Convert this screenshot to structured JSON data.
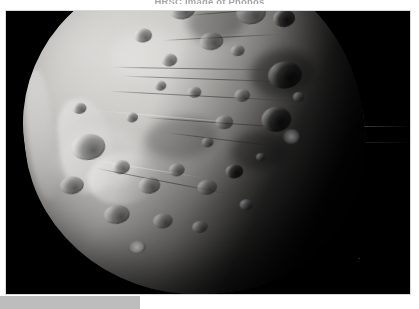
{
  "page": {
    "background_color": "#ffffff",
    "width": 419,
    "height": 309
  },
  "caption": {
    "text": "HRSC image of Phobos",
    "color": "#5c5c5c",
    "clipped": true
  },
  "photo": {
    "name": "phobos-surface-photograph",
    "alt": "Grayscale close-up photograph of Phobos, the larger moon of Mars, showing a heavily cratered surface lit from the upper left with the night side in deep shadow on the lower right",
    "subject": "Phobos",
    "space_color": "#000000",
    "surface_highlight_color": "#d3d1cd",
    "surface_midtone_color": "#949290",
    "surface_shadow_color": "#141414",
    "frame_border_color": "#d8d8d8",
    "features": {
      "lighting_direction": "upper-left",
      "terminator_direction": "lower-right",
      "visible_features": [
        "impact craters",
        "linear grooves",
        "bright limb",
        "escarpment ridge",
        "shadowed basins"
      ]
    }
  },
  "bottom_bar": {
    "name": "bottom-gray-bar",
    "color": "#bdbdbd",
    "width": 140,
    "height": 13
  }
}
